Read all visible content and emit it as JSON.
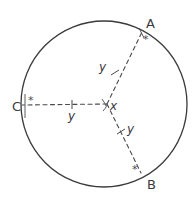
{
  "figure": {
    "type": "circle-geometry-diagram",
    "background_color": "#ffffff",
    "stroke_color": "#3a3a3e",
    "circle": {
      "center_x": 104,
      "center_y": 104,
      "radius": 83,
      "stroke_width": 1.3,
      "style": "solid"
    },
    "center_point": {
      "label": "x",
      "meaning": "central-angle",
      "x": 107,
      "y": 106
    },
    "points": [
      {
        "id": "A",
        "label": "A",
        "star": "*",
        "x": 142,
        "y": 32,
        "label_x": 146,
        "label_y": 20,
        "star_x": 143,
        "star_y": 36
      },
      {
        "id": "B",
        "label": "B",
        "star": "*",
        "x": 141,
        "y": 173,
        "label_x": 146,
        "label_y": 179,
        "star_x": 133,
        "star_y": 166
      },
      {
        "id": "C",
        "label": "C",
        "star": "*",
        "x": 21,
        "y": 106,
        "label_x": 14,
        "label_y": 100,
        "star_x": 28,
        "star_y": 97
      }
    ],
    "radii": [
      {
        "id": "radius-to-A",
        "label": "y",
        "from": "center",
        "to": "A",
        "style": "dashed",
        "label_x": 101,
        "label_y": 66,
        "tick_x": 115,
        "tick_y": 72
      },
      {
        "id": "radius-to-C",
        "label": "y",
        "from": "center",
        "to": "C",
        "style": "dashed",
        "label_x": 69,
        "label_y": 112,
        "tick_x": 72,
        "tick_y": 106
      },
      {
        "id": "radius-to-B",
        "label": "y",
        "from": "center",
        "to": "B",
        "style": "dashed",
        "label_x": 128,
        "label_y": 125,
        "tick_x": 121,
        "tick_y": 131
      }
    ]
  }
}
